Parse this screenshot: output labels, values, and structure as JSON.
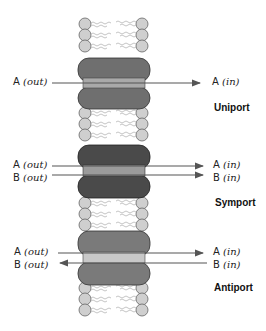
{
  "diagram": {
    "type": "membrane-transport-systems",
    "colors": {
      "lipid_head": "#cfcfcf",
      "lipid_tail": "#b5b5b5",
      "protein_uniport": "#6f6f6f",
      "protein_symport": "#4a4a4a",
      "protein_antiport": "#7a7a7a",
      "channel_band": "#a9a9a9",
      "channel_band_light": "#c8c8c8",
      "arrow": "#555555"
    },
    "panels": [
      {
        "name": "Uniport",
        "labels_left": [
          {
            "letter": "A",
            "side": "out"
          }
        ],
        "labels_right": [
          {
            "letter": "A",
            "side": "in"
          }
        ]
      },
      {
        "name": "Symport",
        "labels_left": [
          {
            "letter": "A",
            "side": "out"
          },
          {
            "letter": "B",
            "side": "out"
          }
        ],
        "labels_right": [
          {
            "letter": "A",
            "side": "in"
          },
          {
            "letter": "B",
            "side": "in"
          }
        ]
      },
      {
        "name": "Antiport",
        "labels_left": [
          {
            "letter": "A",
            "side": "out"
          },
          {
            "letter": "B",
            "side": "out"
          }
        ],
        "labels_right": [
          {
            "letter": "A",
            "side": "in"
          },
          {
            "letter": "B",
            "side": "in"
          }
        ]
      }
    ],
    "text": {
      "uniport_left_a": "A",
      "uniport_left_a_side": "(out)",
      "uniport_right_a": "A",
      "uniport_right_a_side": "(in)",
      "uniport_title": "Uniport",
      "symport_left_a": "A",
      "symport_left_a_side": "(out)",
      "symport_left_b": "B",
      "symport_left_b_side": "(out)",
      "symport_right_a": "A",
      "symport_right_a_side": "(in)",
      "symport_right_b": "B",
      "symport_right_b_side": "(in)",
      "symport_title": "Symport",
      "antiport_left_a": "A",
      "antiport_left_a_side": "(out)",
      "antiport_left_b": "B",
      "antiport_left_b_side": "(out)",
      "antiport_right_a": "A",
      "antiport_right_a_side": "(in)",
      "antiport_right_b": "B",
      "antiport_right_b_side": "(in)",
      "antiport_title": "Antiport"
    }
  }
}
